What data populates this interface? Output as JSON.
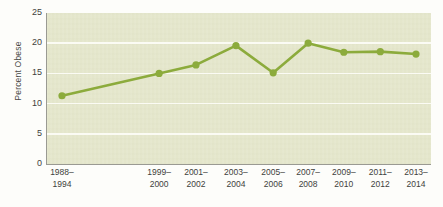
{
  "chart_data": {
    "type": "line",
    "title": "",
    "xlabel": "",
    "ylabel": "Percent Obese",
    "categories": [
      "1988–\n1994",
      "1999–\n2000",
      "2001–\n2002",
      "2003–\n2004",
      "2005–\n2006",
      "2007–\n2008",
      "2009–\n2010",
      "2011–\n2012",
      "2013–\n2014"
    ],
    "values": [
      11.3,
      15.0,
      16.4,
      19.6,
      15.1,
      20.0,
      18.5,
      18.6,
      18.2
    ],
    "x_positions_pct": [
      3.9,
      29.2,
      38.8,
      49.2,
      58.9,
      68.0,
      77.3,
      86.8,
      96.1
    ],
    "ylim": [
      0,
      25
    ],
    "yticks": [
      0,
      5,
      10,
      15,
      20,
      25
    ],
    "ytick_labels": [
      "0",
      "5",
      "10",
      "15",
      "20",
      "25"
    ],
    "grid": true,
    "grid_values": [
      5,
      10,
      15,
      20
    ],
    "legend": null,
    "colors": {
      "line": "#8cab3c",
      "marker": "#8cab3c",
      "plot_background": "#e4e6cb",
      "gridline": "#fbfbf4",
      "axis": "#9a9a92",
      "text": "#3f3f3c",
      "page_background": "#fdfdfa"
    }
  }
}
